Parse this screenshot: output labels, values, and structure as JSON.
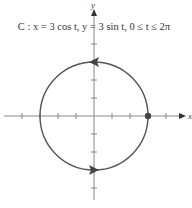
{
  "figure": {
    "title": "C : x = 3 cos t, y = 3 sin t, 0 ≤ t ≤ 2π",
    "x_axis_label": "x",
    "y_axis_label": "y",
    "curve_color": "#555555",
    "axis_color": "#888888",
    "point_color": "#444444"
  },
  "geometry": {
    "origin_px": [
      94,
      116
    ],
    "unit_px": 18,
    "radius_units": 3,
    "x_ticks_units": [
      -4,
      -3,
      -2,
      -1,
      1,
      2,
      3,
      4
    ],
    "y_ticks_units": [
      -4,
      -3,
      -2,
      -1,
      1,
      2,
      3,
      4
    ],
    "start_point_units": [
      3,
      0
    ],
    "orientation": "counterclockwise",
    "arrow_markers": [
      "top (pointing left)",
      "bottom (pointing right)"
    ]
  }
}
